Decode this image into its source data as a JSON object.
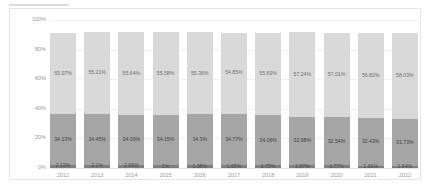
{
  "chart_data": {
    "type": "bar",
    "subtype": "stacked-100-percent",
    "title": "",
    "xlabel": "",
    "ylabel": "Share of GDP",
    "ylim": [
      0,
      100
    ],
    "ytick_labels": [
      "100%",
      "80%",
      "60%",
      "40%",
      "20%",
      "0%"
    ],
    "ytick_values": [
      100,
      80,
      60,
      40,
      20,
      0
    ],
    "grid": true,
    "legend": "none",
    "categories": [
      "2012",
      "2013",
      "2014",
      "2015",
      "2016",
      "2017",
      "2018",
      "2019",
      "2020",
      "2021",
      "2022"
    ],
    "series": [
      {
        "name": "top-segment",
        "color": "#d9d9d9",
        "values": [
          55.07,
          55.21,
          55.64,
          55.58,
          55.36,
          54.85,
          55.69,
          57.24,
          57.01,
          56.82,
          58.03
        ],
        "labels": [
          "55.07%",
          "55.21%",
          "55.64%",
          "55.58%",
          "55.36%",
          "54.85%",
          "55.69%",
          "57.24%",
          "57.01%",
          "56.82%",
          "58.03%"
        ]
      },
      {
        "name": "middle-segment",
        "color": "#a6a6a6",
        "values": [
          34.13,
          34.45,
          34.09,
          34.15,
          34.3,
          34.77,
          34.06,
          32.68,
          32.54,
          32.43,
          31.73
        ],
        "labels": [
          "34.13%",
          "34.45%",
          "34.09%",
          "34.15%",
          "34.3%",
          "34.77%",
          "34.06%",
          "32.68%",
          "32.54%",
          "32.43%",
          "31.73%"
        ]
      },
      {
        "name": "bottom-segment",
        "color": "#7f7f7f",
        "values": [
          2.13,
          2.1,
          2.06,
          2.0,
          1.98,
          1.95,
          1.75,
          1.87,
          1.77,
          1.66,
          1.64
        ],
        "labels": [
          "2.13%",
          "2.1%",
          "2.06%",
          "2%",
          "1.98%",
          "1.95%",
          "1.75%",
          "1.87%",
          "1.77%",
          "1.66%",
          "1.64%"
        ]
      }
    ]
  }
}
